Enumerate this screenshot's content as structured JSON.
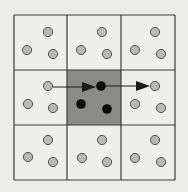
{
  "diagram": {
    "grid": {
      "x0": 14,
      "y0": 15,
      "x1": 175,
      "y1": 180,
      "cols": [
        14,
        67,
        121,
        175
      ],
      "rows": [
        15,
        70,
        125,
        180
      ]
    },
    "colors": {
      "cell": "#eeeeec",
      "center_cell": "#8a8a88",
      "line": "#3a3a3a",
      "particle": "#b8b8b6",
      "particle_stroke": "#505050",
      "active_particle": "#0a0a0a",
      "arrow": "#1a1a1a"
    },
    "center_cell": {
      "col": 1,
      "row": 1
    },
    "particles": [
      [
        48,
        32
      ],
      [
        27,
        50
      ],
      [
        53,
        54
      ],
      [
        102,
        32
      ],
      [
        81,
        50
      ],
      [
        107,
        54
      ],
      [
        155,
        32
      ],
      [
        135,
        50
      ],
      [
        161,
        54
      ],
      [
        48,
        86
      ],
      [
        28,
        104
      ],
      [
        53,
        108
      ],
      [
        155,
        86
      ],
      [
        135,
        104
      ],
      [
        161,
        108
      ],
      [
        48,
        140
      ],
      [
        28,
        157
      ],
      [
        53,
        162
      ],
      [
        102,
        140
      ],
      [
        82,
        158
      ],
      [
        107,
        162
      ],
      [
        155,
        140
      ],
      [
        135,
        158
      ],
      [
        161,
        162
      ]
    ],
    "active_particles": [
      [
        101,
        86
      ],
      [
        81,
        104
      ],
      [
        107,
        109
      ]
    ],
    "arrows": [
      {
        "from": [
          53,
          87
        ],
        "to": [
          96,
          87
        ]
      },
      {
        "from": [
          106,
          86
        ],
        "to": [
          150,
          86
        ]
      }
    ]
  }
}
